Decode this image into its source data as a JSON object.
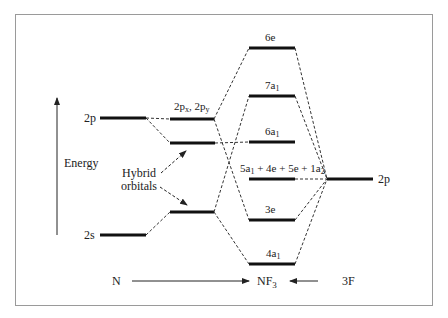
{
  "diagram": {
    "axis": {
      "label": "Energy"
    },
    "n_atom": {
      "label": "N",
      "levels": [
        {
          "id": "n-2p",
          "label": "2p"
        },
        {
          "id": "n-2s",
          "label": "2s"
        }
      ]
    },
    "hybrids": {
      "annotation_line1": "Hybrid",
      "annotation_line2": "orbitals",
      "upper_label_main": "2p",
      "upper_label_sub_x": "x",
      "upper_label_sep": ", 2p",
      "upper_label_sub_y": "y"
    },
    "molecule": {
      "label_main": "NF",
      "label_sub": "3",
      "levels": [
        {
          "id": "6e",
          "main": "6e",
          "sub": ""
        },
        {
          "id": "7a1",
          "main": "7a",
          "sub": "1"
        },
        {
          "id": "6a1",
          "main": "6a",
          "sub": "1"
        },
        {
          "id": "nonbonding",
          "parts": [
            "5a",
            "1",
            " + 4e + 5e + 1a",
            "2"
          ]
        },
        {
          "id": "3e",
          "main": "3e",
          "sub": ""
        },
        {
          "id": "4a1",
          "main": "4a",
          "sub": "1"
        }
      ]
    },
    "f_atoms": {
      "label": "3F",
      "levels": [
        {
          "id": "f-2p",
          "label": "2p"
        }
      ]
    },
    "colors": {
      "level": "#111111",
      "dash": "#333333",
      "frame": "#9a9a9a",
      "text": "#222222"
    }
  }
}
